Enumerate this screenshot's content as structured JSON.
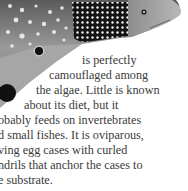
{
  "illustration": {
    "subject": "shark",
    "body_color": "#8a8a8a",
    "spot_patch_color": "#141414",
    "spot_color": "#f4f4f4"
  },
  "text": {
    "lines": [
      "is perfectly",
      "camouflaged among",
      "the algae. Little is known",
      "about its diet, but it",
      "obably feeds on invertebrates",
      "d small fishes. It is oviparous,",
      "ving egg cases with curled",
      "ndrils that anchor the cases to",
      "e substrate."
    ]
  }
}
